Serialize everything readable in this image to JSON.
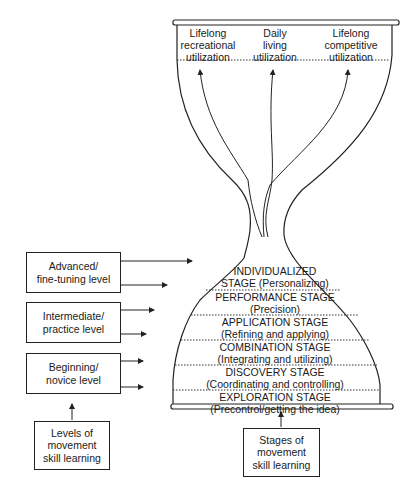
{
  "diagram": {
    "top_outcomes": [
      {
        "lines": [
          "Lifelong",
          "recreational",
          "utilization"
        ]
      },
      {
        "lines": [
          "Daily",
          "living",
          "utilization"
        ]
      },
      {
        "lines": [
          "Lifelong",
          "competitive",
          "utilization"
        ]
      }
    ],
    "stages": [
      {
        "name": "INDIVIDUALIZED",
        "desc": "STAGE (Personalizing)"
      },
      {
        "name": "PERFORMANCE STAGE",
        "desc": "(Precision)"
      },
      {
        "name": "APPLICATION STAGE",
        "desc": "(Refining and applying)"
      },
      {
        "name": "COMBINATION STAGE",
        "desc": "(Integrating and utilizing)"
      },
      {
        "name": "DISCOVERY STAGE",
        "desc": "(Coordinating and controlling)"
      },
      {
        "name": "EXPLORATION  STAGE",
        "desc": "(Precontrol/getting the idea)"
      }
    ],
    "levels": [
      {
        "lines": [
          "Advanced/",
          "fine-tuning level"
        ]
      },
      {
        "lines": [
          "Intermediate/",
          "practice level"
        ]
      },
      {
        "lines": [
          "Beginning/",
          "novice level"
        ]
      }
    ],
    "levels_caption": {
      "lines": [
        "Levels of",
        "movement",
        "skill learning"
      ]
    },
    "stages_caption": {
      "lines": [
        "Stages of",
        "movement",
        "skill learning"
      ]
    }
  }
}
